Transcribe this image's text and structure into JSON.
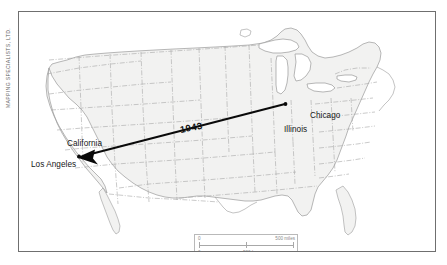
{
  "credit": {
    "text": "MAPPING SPECIALISTS, LTD."
  },
  "map": {
    "region": "Continental United States",
    "background_color": "#ffffff",
    "land_fill": "#f2f2f1",
    "state_border_color": "#a9a9a9",
    "coast_color": "#9a9a9a",
    "frame_color": "#6f6f6f",
    "lake_fill": "#ffffff"
  },
  "labels": {
    "chicago": "Chicago",
    "illinois": "Illinois",
    "california": "California",
    "los_angeles": "Los Angeles"
  },
  "migration_arrow": {
    "year_label": "1943",
    "origin": "Chicago",
    "destination": "Los Angeles",
    "origin_point": {
      "x": 285,
      "y": 103
    },
    "destination_point": {
      "x": 78,
      "y": 155
    },
    "color": "#0a0a0a",
    "direction": "east-to-west"
  },
  "scale_bar": {
    "miles": {
      "zero": "0",
      "value": "500 miles"
    },
    "km": {
      "zero": "0",
      "value": "500 km"
    },
    "line_color": "#a8a8a8"
  }
}
